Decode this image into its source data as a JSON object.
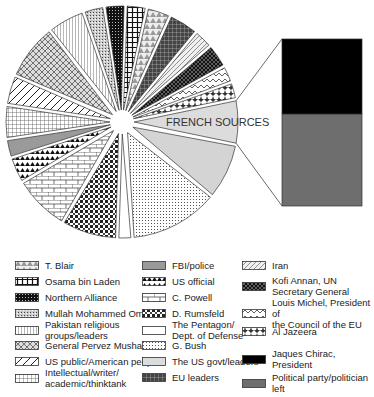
{
  "chart_data": {
    "type": "pie",
    "title": "",
    "exploded": true,
    "detail_bar": {
      "label": "FRENCH SOURCES",
      "segments": [
        {
          "name": "Jaques Chirac, President",
          "value": 45,
          "color": "#000000"
        },
        {
          "name": "Political party/politician left",
          "value": 55,
          "color": "#6e6e6e"
        }
      ]
    },
    "slices": [
      {
        "name": "FRENCH SOURCES",
        "value": 6.0,
        "pattern": "lightgray",
        "label_on_slice": true
      },
      {
        "name": "The US govt/leaders",
        "value": 7.5,
        "pattern": "lightgray2"
      },
      {
        "name": "G. Bush",
        "value": 12.0,
        "pattern": "dots"
      },
      {
        "name": "The Pentagon/ Dept. of Defense",
        "value": 2.0,
        "pattern": "white"
      },
      {
        "name": "D. Rumsfeld",
        "value": 7.5,
        "pattern": "darkcheck"
      },
      {
        "name": "C. Powell",
        "value": 7.5,
        "pattern": "bricks"
      },
      {
        "name": "US official",
        "value": 3.5,
        "pattern": "blacktriangles"
      },
      {
        "name": "FBI/police",
        "value": 2.5,
        "pattern": "gray"
      },
      {
        "name": "Intellectual/writer/ academic/thinktank",
        "value": 4.5,
        "pattern": "grid"
      },
      {
        "name": "US public/American people",
        "value": 4.0,
        "pattern": "diagonal"
      },
      {
        "name": "General Pervez Musharraf",
        "value": 7.5,
        "pattern": "crosshatch"
      },
      {
        "name": "Pakistan religious groups/leaders",
        "value": 5.0,
        "pattern": "vlines"
      },
      {
        "name": "Mullah Mohammed Omar",
        "value": 2.8,
        "pattern": "finedots"
      },
      {
        "name": "Northern Alliance",
        "value": 2.8,
        "pattern": "darkgrid"
      },
      {
        "name": "Osama bin Laden",
        "value": 2.8,
        "pattern": "plusgrid"
      },
      {
        "name": "T. Blair",
        "value": 3.2,
        "pattern": "triangles"
      },
      {
        "name": "EU leaders",
        "value": 4.0,
        "pattern": "eugrid"
      },
      {
        "name": "Iran",
        "value": 2.6,
        "pattern": "irandiag"
      },
      {
        "name": "Kofi Annan, UN Secretary General",
        "value": 3.2,
        "pattern": "blackcross"
      },
      {
        "name": "Louis Michel, President of the Council of the EU",
        "value": 2.3,
        "pattern": "zigzag"
      },
      {
        "name": "Al Jazeera",
        "value": 2.3,
        "pattern": "stars"
      }
    ],
    "legend": [
      {
        "label": "T. Blair",
        "pattern": "triangles"
      },
      {
        "label": "Osama bin Laden",
        "pattern": "plusgrid"
      },
      {
        "label": "Northern Alliance",
        "pattern": "darkgrid"
      },
      {
        "label": "Mullah Mohammed Omar",
        "pattern": "finedots"
      },
      {
        "label": "Pakistan religious\ngroups/leaders",
        "pattern": "vlines"
      },
      {
        "label": "General Pervez Musharraf",
        "pattern": "crosshatch"
      },
      {
        "label": "US public/American people",
        "pattern": "diagonal"
      },
      {
        "label": "Intellectual/writer/\nacademic/thinktank",
        "pattern": "grid"
      },
      {
        "label": "FBI/police",
        "pattern": "gray"
      },
      {
        "label": "US official",
        "pattern": "blacktriangles"
      },
      {
        "label": "C. Powell",
        "pattern": "bricks"
      },
      {
        "label": "D. Rumsfeld",
        "pattern": "darkcheck"
      },
      {
        "label": "The Pentagon/\nDept. of Defense",
        "pattern": "white"
      },
      {
        "label": "G. Bush",
        "pattern": "dots"
      },
      {
        "label": "The US govt/leaders",
        "pattern": "lightgray"
      },
      {
        "label": "EU leaders",
        "pattern": "eugrid"
      },
      {
        "label": "Iran",
        "pattern": "irandiag"
      },
      {
        "label": "Kofi Annan, UN\nSecretary General",
        "pattern": "blackcross"
      },
      {
        "label": "Louis Michel, President of\nthe Council of the EU",
        "pattern": "zigzag"
      },
      {
        "label": "Al Jazeera",
        "pattern": "stars"
      },
      {
        "label": "Jaques Chirac, President",
        "pattern": "black"
      },
      {
        "label": "Political party/politician left",
        "pattern": "darkgray"
      }
    ],
    "legend_position": "bottom"
  }
}
